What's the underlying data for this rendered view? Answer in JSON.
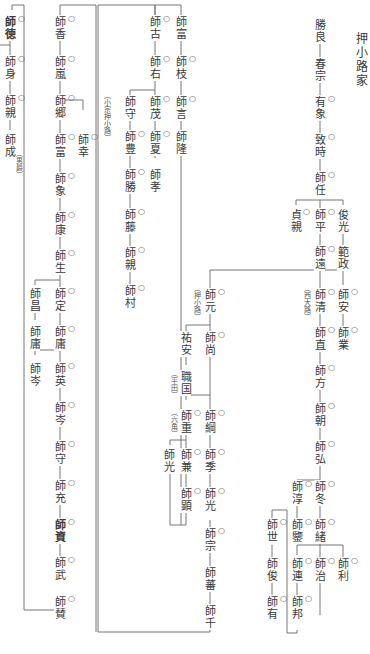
{
  "title": "押小路家",
  "mark_symbol": "○",
  "nodes": {
    "katsuyoshi": "勝良",
    "harumune": "春宗",
    "arikata": "有象",
    "munetoki": "致時",
    "moroto": "師任",
    "sadachika": "貞親",
    "morohira": "師平",
    "toshimitsu": "俊光",
    "norimasa": "範政",
    "morotou": "師遠",
    "moroyasu": "師安",
    "morokiyo": "師清",
    "moronari_a": "師業",
    "moronao": "師直",
    "morokata": "師方",
    "morotomo": "師朝",
    "morohiro": "師弘",
    "moroatsu": "師淳",
    "morofuyu": "師冬",
    "morokan": "師鑒",
    "morotsugu": "師緒",
    "morotsura": "師連",
    "moroharu": "師治",
    "morotoshi": "師利",
    "morokuni": "師邦",
    "moroyo": "師世",
    "morotoshi2": "師俊",
    "moroari": "師有",
    "moromoto": "師元",
    "sukeyasu": "祐安",
    "morohisa": "師尚",
    "shikikuni": "職国",
    "moroshige": "師重",
    "morotsuna": "師綱",
    "moromitsu_a": "師光",
    "morokane": "師兼",
    "morosue": "師季",
    "morosuke": "師顕",
    "moromitsu_b": "師光",
    "moromune": "師宗",
    "moroshige2": "師蕃",
    "morosen": "師千",
    "morotomi_top": "師富",
    "morofuru": "師古",
    "moroeda": "師枝",
    "moroseki": "師右",
    "morokoto": "師言",
    "moroshige3": "師茂",
    "moromori": "師守",
    "morotaka": "師隆",
    "moronatsu": "師夏",
    "morotoyo": "師豊",
    "morotaka2": "師孝",
    "morokatsu": "師勝",
    "morofuji": "師藤",
    "morochika_b": "師親",
    "moromura": "師村",
    "morotoku": "師徳",
    "moromi": "師身",
    "morochika": "師親",
    "moronari": "師成",
    "morokou": "師香",
    "moroarashi": "師嵐",
    "morogou": "師郷",
    "morotomi": "師富",
    "morosachi": "師幸",
    "morozou": "師象",
    "moroyasu2": "師康",
    "moroiki": "師生",
    "moromasa": "師昌",
    "morosada": "師定",
    "moroyo2": "師庸",
    "moroyo3": "師庸",
    "morogin": "師岑",
    "morohide": "師英",
    "morokishi": "師岑",
    "moromori2": "師守",
    "moromitsu_c": "師充",
    "moroshi": "師資",
    "morotake": "師武",
    "morosan": "師賛"
  },
  "notes": {
    "oshikouji": "（押小路）",
    "minoodai": "（西大路）",
    "hirata": "（平田）",
    "rokkaku": "（六角）",
    "komune": "（小宗押小路）",
    "otoko": "（男爵）"
  }
}
